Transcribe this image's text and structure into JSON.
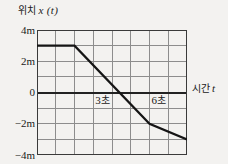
{
  "axes": {
    "y_title_korean": "위치",
    "y_title_math": "x (t)",
    "x_title_korean": "시간",
    "x_title_math": "t"
  },
  "y_ticks": [
    {
      "label": "4m",
      "value": 4
    },
    {
      "label": "2m",
      "value": 2
    },
    {
      "label": "0",
      "value": 0
    },
    {
      "label": "−2m",
      "value": -2
    },
    {
      "label": "−4m",
      "value": -4
    }
  ],
  "annotations": [
    {
      "name": "t3-marker",
      "number": "3",
      "unit": "초",
      "x": 3,
      "y": -0.55
    },
    {
      "name": "t6-marker",
      "number": "6",
      "unit": "초",
      "x": 6,
      "y": -0.55
    }
  ],
  "colors": {
    "background": "#f3f2f0",
    "grid": "#8d8d8d",
    "frame": "#3a3a3a",
    "zero_axis": "#222222",
    "curve": "#151515",
    "text": "#1a1a1a"
  },
  "chart_data": {
    "type": "line",
    "title": "",
    "xlabel": "시간 t",
    "ylabel": "위치 x (t)",
    "xlim": [
      0,
      8
    ],
    "ylim": [
      -4,
      4
    ],
    "xtick_step": 1,
    "ytick_step": 1,
    "ytick_label_step": 2,
    "grid": true,
    "legend": false,
    "series": [
      {
        "name": "x(t)",
        "x": [
          0,
          2,
          6,
          8
        ],
        "y": [
          3,
          3,
          -2,
          -3
        ],
        "points": [
          {
            "t": 0,
            "x": 3
          },
          {
            "t": 2,
            "x": 3
          },
          {
            "t": 6,
            "x": -2
          },
          {
            "t": 8,
            "x": -3
          }
        ],
        "zero_crossing_t": 4.4,
        "segments": [
          {
            "from_t": 0,
            "to_t": 2,
            "slope": 0,
            "description": "at rest at 3 m"
          },
          {
            "from_t": 2,
            "to_t": 6,
            "slope": -1.25,
            "description": "moving in −x direction"
          },
          {
            "from_t": 6,
            "to_t": 8,
            "slope": -0.5,
            "description": "slower motion in −x direction"
          }
        ]
      }
    ]
  }
}
